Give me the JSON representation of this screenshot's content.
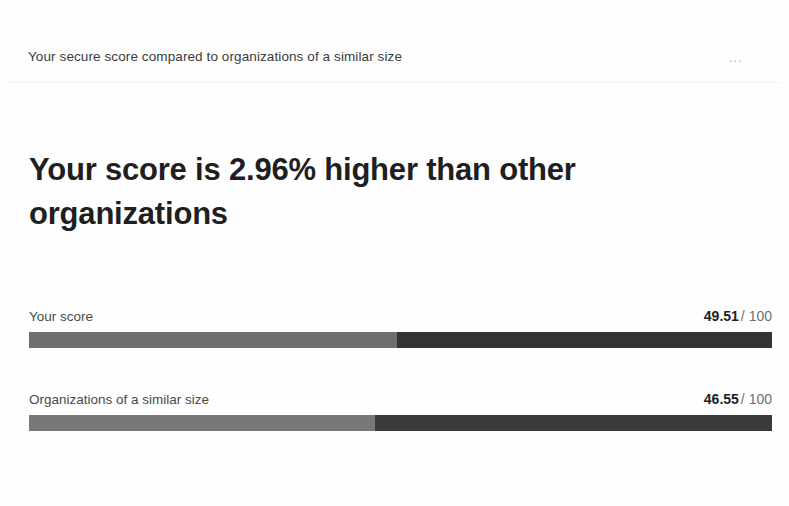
{
  "header": {
    "title": "Your secure score compared to organizations of a similar size",
    "overflow_label": "…"
  },
  "headline": "Your score is 2.96% higher than other organizations",
  "chart_data": {
    "type": "bar",
    "title": "Your secure score compared to organizations of a similar size",
    "xlabel": "",
    "ylabel": "",
    "xlim": [
      0,
      100
    ],
    "grid": false,
    "legend": "none",
    "orientation": "horizontal",
    "max_value": 100,
    "max_suffix": "/ 100",
    "categories": [
      "Your score",
      "Organizations of a similar size"
    ],
    "values": [
      49.51,
      46.55
    ],
    "annotation": "Your score is 2.96% higher than other organizations",
    "bars": [
      {
        "label": "Your score",
        "value": "49.51",
        "value_number": 49.51,
        "max_text": "/ 100",
        "percent": 49.51,
        "color_filled": "#6e6e6e",
        "color_remainder": "#333333"
      },
      {
        "label": "Organizations of a similar size",
        "value": "46.55",
        "value_number": 46.55,
        "max_text": "/ 100",
        "percent": 46.55,
        "color_filled": "#787878",
        "color_remainder": "#3a3a3a"
      }
    ]
  }
}
